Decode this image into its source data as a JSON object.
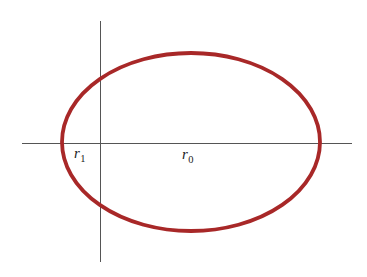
{
  "figure": {
    "background_color": "#ffffff",
    "width": 367,
    "height": 277,
    "axis_color": "#555555",
    "curve_color": "#a82828"
  },
  "labels": {
    "r1": {
      "symbol": "r",
      "subscript": "1",
      "full_text": "r1",
      "x": 74,
      "y": 146
    },
    "r0": {
      "symbol": "r",
      "subscript": "0",
      "full_text": "r0",
      "x": 182,
      "y": 147
    }
  },
  "chart_data": {
    "type": "line",
    "title": "",
    "subtitle": "",
    "xlabel": "",
    "ylabel": "",
    "grid": false,
    "legend_position": "none",
    "axes": {
      "x_axis": {
        "orientation": "horizontal",
        "y_pixel": 143,
        "x_start_pixel": 22,
        "x_end_pixel": 352,
        "color": "#555555",
        "stroke_width": 1,
        "ticks": [],
        "tick_labels": []
      },
      "y_axis": {
        "orientation": "vertical",
        "x_pixel": 100,
        "y_start_pixel": 21,
        "y_end_pixel": 262,
        "color": "#555555",
        "stroke_width": 1,
        "ticks": [],
        "tick_labels": []
      },
      "origin": {
        "x_pixel": 100,
        "y_pixel": 143
      }
    },
    "series": [
      {
        "name": "ellipse",
        "shape": "ellipse",
        "color": "#a82828",
        "stroke_width": 3.8,
        "center_x_pixel": 191,
        "center_y_pixel": 142,
        "semi_axis_x_pixel": 129,
        "semi_axis_y_pixel": 89,
        "left_vertex_x_pixel": 62,
        "right_vertex_x_pixel": 320,
        "top_vertex_y_pixel": 53,
        "bottom_vertex_y_pixel": 231
      }
    ],
    "annotations": [
      {
        "name": "r1",
        "text": "r1",
        "rendered": "r₁",
        "x_pixel": 74,
        "y_pixel": 146,
        "description": "distance from origin to near vertex of ellipse"
      },
      {
        "name": "r0",
        "text": "r0",
        "rendered": "r₀",
        "x_pixel": 182,
        "y_pixel": 147,
        "description": "distance from origin to far vertex of ellipse"
      }
    ]
  }
}
